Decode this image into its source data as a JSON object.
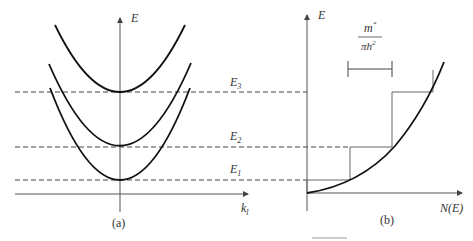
{
  "diagram": {
    "panel_a": {
      "caption": "(a)",
      "y_axis_label": "E",
      "x_axis_label": "k",
      "x_axis_subscript": "l",
      "subbands": [
        "E1",
        "E2",
        "E3"
      ],
      "level_labels": [
        {
          "main": "E",
          "sub": "1"
        },
        {
          "main": "E",
          "sub": "2"
        },
        {
          "main": "E",
          "sub": "3"
        }
      ]
    },
    "panel_b": {
      "caption": "(b)",
      "y_axis_label": "E",
      "x_axis_label": "N(E)",
      "step_annotation": {
        "numerator": "m*",
        "numerator_main": "m",
        "numerator_sup": "*",
        "denominator": "πħ²",
        "denominator_main": "πh",
        "denominator_sup": "2"
      }
    },
    "colors": {
      "curve": "#111111",
      "axis": "#555555",
      "dashed": "#444444",
      "text": "#333333"
    }
  }
}
